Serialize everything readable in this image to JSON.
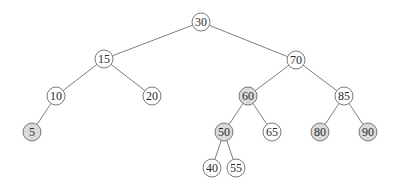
{
  "diagram": {
    "type": "binary-search-tree",
    "colors": {
      "node_fill": "#ffffff",
      "shaded_fill": "#dadada",
      "stroke": "#6a6a6a",
      "edge": "#6e6e6e"
    },
    "nodes": [
      {
        "id": "n30",
        "label": "30",
        "x": 201,
        "y": 22,
        "shaded": false
      },
      {
        "id": "n15",
        "label": "15",
        "x": 104,
        "y": 59,
        "shaded": false
      },
      {
        "id": "n70",
        "label": "70",
        "x": 296,
        "y": 60,
        "shaded": false
      },
      {
        "id": "n10",
        "label": "10",
        "x": 56,
        "y": 96,
        "shaded": false
      },
      {
        "id": "n20",
        "label": "20",
        "x": 152,
        "y": 96,
        "shaded": false
      },
      {
        "id": "n60",
        "label": "60",
        "x": 248,
        "y": 96,
        "shaded": true
      },
      {
        "id": "n85",
        "label": "85",
        "x": 344,
        "y": 96,
        "shaded": false
      },
      {
        "id": "n5",
        "label": "5",
        "x": 32,
        "y": 132,
        "shaded": true
      },
      {
        "id": "n50",
        "label": "50",
        "x": 224,
        "y": 132,
        "shaded": true
      },
      {
        "id": "n65",
        "label": "65",
        "x": 272,
        "y": 132,
        "shaded": false
      },
      {
        "id": "n80",
        "label": "80",
        "x": 320,
        "y": 132,
        "shaded": true
      },
      {
        "id": "n90",
        "label": "90",
        "x": 368,
        "y": 132,
        "shaded": true
      },
      {
        "id": "n40",
        "label": "40",
        "x": 212,
        "y": 168,
        "shaded": false
      },
      {
        "id": "n55",
        "label": "55",
        "x": 236,
        "y": 168,
        "shaded": false
      }
    ],
    "edges": [
      [
        "n30",
        "n15"
      ],
      [
        "n30",
        "n70"
      ],
      [
        "n15",
        "n10"
      ],
      [
        "n15",
        "n20"
      ],
      [
        "n70",
        "n60"
      ],
      [
        "n70",
        "n85"
      ],
      [
        "n10",
        "n5"
      ],
      [
        "n60",
        "n50"
      ],
      [
        "n60",
        "n65"
      ],
      [
        "n85",
        "n80"
      ],
      [
        "n85",
        "n90"
      ],
      [
        "n50",
        "n40"
      ],
      [
        "n50",
        "n55"
      ]
    ],
    "radius": 9
  }
}
